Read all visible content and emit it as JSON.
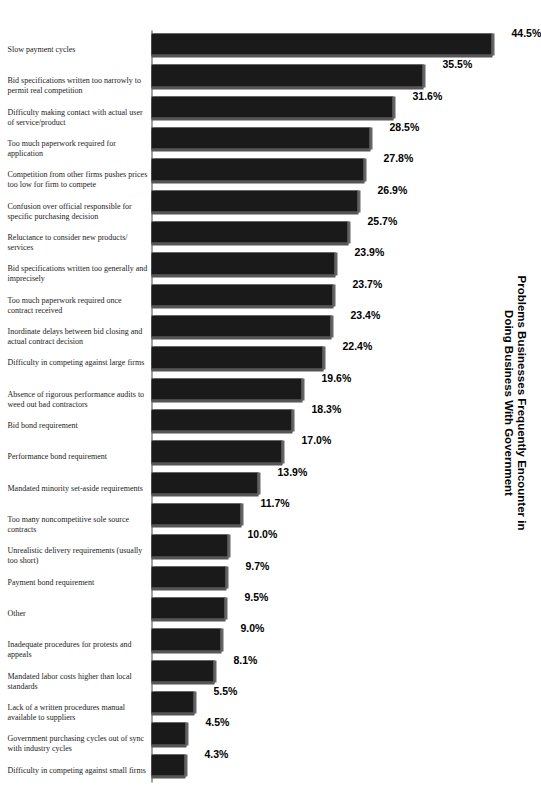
{
  "chart_data": {
    "type": "bar",
    "title": "Problems Businesses Frequently Encounter in Doing Business With Government",
    "title_lines": [
      "Problems Businesses Frequently Encounter in",
      "Doing Business With Government"
    ],
    "xlabel": "",
    "ylabel": "",
    "ylim": [
      0,
      44.5
    ],
    "grid": false,
    "legend": null,
    "orientation": "vertical-bars-rotated-90deg",
    "value_suffix": "%",
    "bar_color": "#1a1a1a",
    "categories": [
      "Slow payment cycles",
      "Bid specifications written too narrowly to permit real competition",
      "Difficulty making contact with actual user of service/product",
      "Too much paperwork required for application",
      "Competition from other firms pushes prices too low for firm to compete",
      "Confusion over official responsible for specific purchasing decision",
      "Reluctance to consider new products/ services",
      "Bid specifications written too generally and imprecisely",
      "Too much paperwork required once contract received",
      "Inordinate delays between bid closing and actual contract decision",
      "Difficulty in competing against large firms",
      "Absence of rigorous performance audits to weed out bad contractors",
      "Bid bond requirement",
      "Performance bond requirement",
      "Mandated minority set-aside requirements",
      "Too many noncompetitive sole source contracts",
      "Unrealistic delivery requirements (usually too short)",
      "Payment bond requirement",
      "Other",
      "Inadequate procedures for protests and appeals",
      "Mandated labor costs higher than local standards",
      "Lack of a written procedures manual available to suppliers",
      "Government purchasing cycles out of sync with industry cycles",
      "Difficulty in competing against small firms"
    ],
    "values": [
      44.5,
      35.5,
      31.6,
      28.5,
      27.8,
      26.9,
      25.7,
      23.9,
      23.7,
      23.4,
      22.4,
      19.6,
      18.3,
      17.0,
      13.9,
      11.7,
      10.0,
      9.7,
      9.5,
      9.0,
      8.1,
      5.5,
      4.5,
      4.3
    ],
    "value_labels": [
      "44.5%",
      "35.5%",
      "31.6%",
      "28.5%",
      "27.8%",
      "26.9%",
      "25.7%",
      "23.9%",
      "23.7%",
      "23.4%",
      "22.4%",
      "19.6%",
      "18.3%",
      "17.0%",
      "13.9%",
      "11.7%",
      "10.0%",
      "9.7%",
      "9.5%",
      "9.0%",
      "8.1%",
      "5.5%",
      "4.5%",
      "4.3%"
    ]
  }
}
